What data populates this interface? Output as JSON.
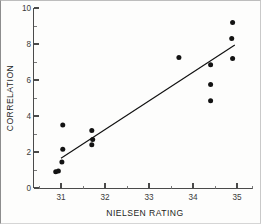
{
  "chart_data": {
    "type": "scatter",
    "title": "",
    "xlabel": "NIELSEN RATING",
    "ylabel": "CORRELATION",
    "xlim": [
      30.6,
      35.5
    ],
    "ylim": [
      0,
      10
    ],
    "xticks": [
      31,
      32,
      33,
      34,
      35
    ],
    "xtick_labels": [
      "31",
      "32",
      "33",
      "34",
      "35"
    ],
    "xticks_minor": [
      30.5,
      31.5,
      32.5,
      33.5,
      34.5,
      35.5
    ],
    "yticks": [
      0,
      2,
      4,
      6,
      8,
      10
    ],
    "ytick_labels": [
      "0",
      "2",
      "4",
      "6",
      "8",
      "10"
    ],
    "yticks_minor": [
      1,
      3,
      5,
      7,
      9
    ],
    "grid": false,
    "legend": null,
    "marker": "filled-circle",
    "marker_color": "#131313",
    "points": [
      {
        "x": 30.88,
        "y": 0.9
      },
      {
        "x": 30.94,
        "y": 0.95
      },
      {
        "x": 31.02,
        "y": 1.45
      },
      {
        "x": 31.04,
        "y": 2.15
      },
      {
        "x": 31.04,
        "y": 3.5
      },
      {
        "x": 31.7,
        "y": 2.4
      },
      {
        "x": 31.72,
        "y": 2.7
      },
      {
        "x": 31.7,
        "y": 3.2
      },
      {
        "x": 33.68,
        "y": 7.25
      },
      {
        "x": 34.4,
        "y": 4.85
      },
      {
        "x": 34.4,
        "y": 5.75
      },
      {
        "x": 34.4,
        "y": 6.85
      },
      {
        "x": 34.9,
        "y": 7.2
      },
      {
        "x": 34.88,
        "y": 8.3
      },
      {
        "x": 34.9,
        "y": 9.2
      }
    ],
    "trend_line": {
      "type": "linear-fit",
      "x0": 31.0,
      "y0": 1.65,
      "x1": 34.95,
      "y1": 7.95,
      "color": "#101010"
    }
  },
  "axes": {
    "x_axis_name": "x-axis",
    "y_axis_name": "y-axis"
  }
}
